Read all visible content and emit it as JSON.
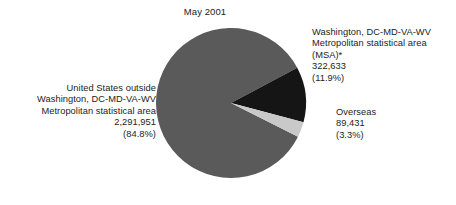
{
  "chart_data": {
    "type": "pie",
    "title": "May 2001",
    "categories": [
      "United States outside Washington, DC-MD-VA-WV Metropolitan statistical area",
      "Washington, DC-MD-VA-WV Metropolitan statistical area (MSA)*",
      "Overseas"
    ],
    "values": [
      2291951,
      322633,
      89431
    ],
    "percentages": [
      84.8,
      11.9,
      3.3
    ],
    "colors": [
      "#5a5a5a",
      "#151515",
      "#c9c9c9"
    ],
    "legend_position": "callout-labels",
    "grid": false,
    "xlabel": "",
    "ylabel": "",
    "slices": [
      {
        "name": "us-outside-msa",
        "label_lines": [
          "United States outside",
          "Washington, DC-MD-VA-WV",
          "Metropolitan statistical area",
          "2,291,951",
          "(84.8%)"
        ],
        "value_text": "2,291,951",
        "percent_text": "(84.8%)",
        "value": 2291951,
        "percent": 84.8,
        "color": "#5a5a5a"
      },
      {
        "name": "washington-msa",
        "label_lines": [
          "Washington, DC-MD-VA-WV",
          "Metropolitan statistical area",
          "(MSA)*",
          "322,633",
          "(11.9%)"
        ],
        "value_text": "322,633",
        "percent_text": "(11.9%)",
        "value": 322633,
        "percent": 11.9,
        "color": "#151515"
      },
      {
        "name": "overseas",
        "label_lines": [
          "Overseas",
          "89,431",
          "(3.3%)"
        ],
        "value_text": "89,431",
        "percent_text": "(3.3%)",
        "value": 89431,
        "percent": 3.3,
        "color": "#c9c9c9"
      }
    ]
  },
  "title": {
    "text": "May 2001"
  },
  "labels": {
    "us_outside": {
      "line1": "United States outside",
      "line2": "Washington, DC-MD-VA-WV",
      "line3": "Metropolitan statistical area",
      "line4": "2,291,951",
      "line5": "(84.8%)"
    },
    "msa": {
      "line1": "Washington, DC-MD-VA-WV",
      "line2": "Metropolitan statistical area",
      "line3": "(MSA)*",
      "line4": "322,633",
      "line5": "(11.9%)"
    },
    "overseas": {
      "line1": "Overseas",
      "line2": "89,431",
      "line3": "(3.3%)"
    }
  }
}
